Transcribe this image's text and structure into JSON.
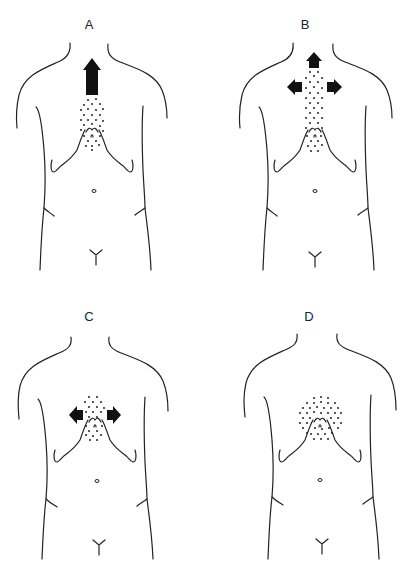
{
  "figure": {
    "panels": [
      {
        "id": "A",
        "label": "A",
        "stipple_region": "lower sternum to epigastrium, narrow vertical oval",
        "arrows": [
          "up"
        ]
      },
      {
        "id": "B",
        "label": "B",
        "stipple_region": "entire sternum, long vertical band",
        "arrows": [
          "up",
          "left",
          "right"
        ]
      },
      {
        "id": "C",
        "label": "C",
        "stipple_region": "xiphoid / epigastrium, small oval",
        "arrows": [
          "left",
          "right"
        ]
      },
      {
        "id": "D",
        "label": "D",
        "stipple_region": "epigastrium, large circular area",
        "arrows": []
      }
    ],
    "colors": {
      "line": "#222222",
      "arrow": "#111111",
      "dot": "#222222",
      "background": "#ffffff"
    }
  }
}
